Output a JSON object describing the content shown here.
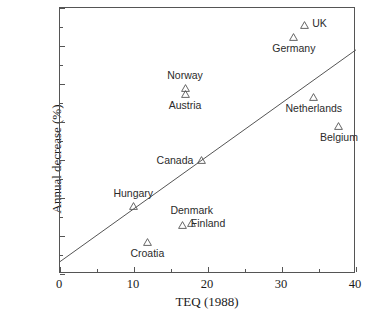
{
  "chart_data": {
    "type": "scatter",
    "title": "",
    "xlabel": "TEQ (1988)",
    "ylabel": "Annual decrease (%)",
    "xlim": [
      0,
      40
    ],
    "ylim": [
      0,
      14
    ],
    "xticks": [
      0,
      10,
      20,
      30,
      40
    ],
    "yticks": [
      0,
      2,
      4,
      6,
      8,
      10,
      12,
      14
    ],
    "xtick_labels": [
      "0",
      "10",
      "20",
      "30",
      "40"
    ],
    "ytick_labels": [
      "0",
      "2",
      "4",
      "6",
      "8",
      "10",
      "12",
      "14"
    ],
    "x_minor_ticks": [
      5,
      15,
      25,
      35
    ],
    "y_minor_ticks": [
      1,
      3,
      5,
      7,
      9,
      11,
      13
    ],
    "grid": false,
    "legend": "none",
    "marker_style": "open-triangle",
    "marker_color": "#555555",
    "line_color": "#555555",
    "axis_color": "#555555",
    "points": [
      {
        "label": "UK",
        "x": 33.0,
        "y": 13.1,
        "label_pos": "right"
      },
      {
        "label": "Germany",
        "x": 31.6,
        "y": 12.5,
        "label_pos": "below"
      },
      {
        "label": "Norway",
        "x": 16.9,
        "y": 9.8,
        "label_pos": "above"
      },
      {
        "label": "Austria",
        "x": 16.9,
        "y": 9.5,
        "label_pos": "below"
      },
      {
        "label": "Netherlands",
        "x": 34.3,
        "y": 9.3,
        "label_pos": "below"
      },
      {
        "label": "Belgium",
        "x": 37.7,
        "y": 7.8,
        "label_pos": "below"
      },
      {
        "label": "Canada",
        "x": 19.1,
        "y": 6.0,
        "label_pos": "left"
      },
      {
        "label": "Hungary",
        "x": 9.9,
        "y": 3.6,
        "label_pos": "above"
      },
      {
        "label": "Denmark",
        "x": 17.8,
        "y": 2.7,
        "label_pos": "above"
      },
      {
        "label": "Finland",
        "x": 16.6,
        "y": 2.6,
        "label_pos": "right"
      },
      {
        "label": "Croatia",
        "x": 11.8,
        "y": 1.7,
        "label_pos": "below"
      }
    ],
    "fit_line": {
      "x0": 0.0,
      "y0": 0.65,
      "x1": 40.0,
      "y1": 11.8
    }
  }
}
